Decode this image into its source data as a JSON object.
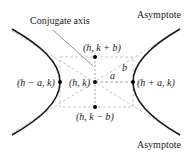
{
  "diagram": {
    "type": "hyperbola-horizontal-transverse-axis",
    "colors": {
      "curve": "#1a1a1a",
      "asymptote": "#c8c8c8",
      "box": "#c8c8c8",
      "leader": "#555555",
      "point": "#000000",
      "text": "#222222"
    },
    "labels": {
      "conjugate_axis": "Conjugate axis",
      "asymptote_top": "Asymptote",
      "asymptote_bottom": "Asymptote",
      "center": "(h, k)",
      "vertex_right": "(h + a, k)",
      "vertex_left": "(h − a, k)",
      "covertex_top": "(h, k + b)",
      "covertex_bottom": "(h, k − b)",
      "a": "a",
      "b": "b"
    },
    "points": [
      {
        "name": "center",
        "label": "(h, k)"
      },
      {
        "name": "vertex-right",
        "label": "(h + a, k)"
      },
      {
        "name": "vertex-left",
        "label": "(h − a, k)"
      },
      {
        "name": "covertex-top",
        "label": "(h, k + b)"
      },
      {
        "name": "covertex-bottom",
        "label": "(h, k − b)"
      }
    ]
  }
}
